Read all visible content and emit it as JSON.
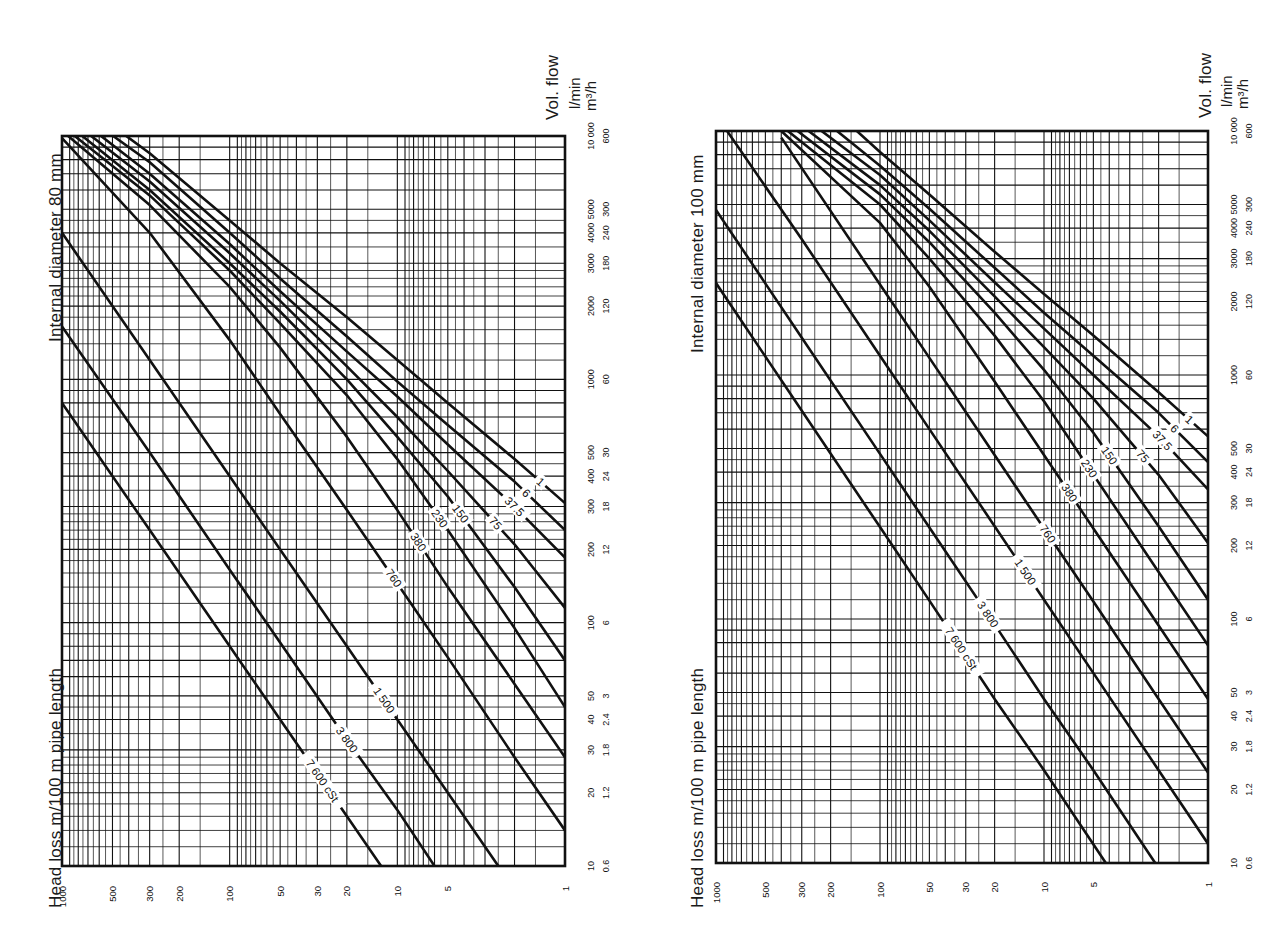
{
  "chart_data": [
    {
      "type": "line",
      "title": "Internal diameter 80 mm",
      "xlabel": "Head loss m/100 m pipe length",
      "ylabel": "Vol. flow",
      "y_units": [
        "l/min",
        "m³/h"
      ],
      "x_scale": "log",
      "y_scale": "log",
      "x_ticks": [
        1000,
        500,
        300,
        200,
        100,
        50,
        30,
        20,
        10,
        5,
        1
      ],
      "x_tick_labels": [
        "1000",
        "500",
        "300",
        "200",
        "100",
        "50",
        "30",
        "20",
        "10",
        "5",
        "1"
      ],
      "y_ticks_lmin": [
        10,
        20,
        30,
        40,
        50,
        100,
        200,
        300,
        400,
        500,
        1000,
        2000,
        3000,
        4000,
        5000,
        10000
      ],
      "y_tick_labels_lmin": [
        "10",
        "20",
        "30",
        "40",
        "50",
        "100",
        "200",
        "300",
        "400",
        "500",
        "1000",
        "2000",
        "3000",
        "4000",
        "5000",
        "10 000"
      ],
      "y_tick_labels_m3h": [
        "0.6",
        "1.2",
        "1.8",
        "2.4",
        "3",
        "6",
        "12",
        "18",
        "24",
        "30",
        "60",
        "120",
        "180",
        "240",
        "300",
        "600"
      ],
      "xlim": [
        1000,
        1
      ],
      "ylim": [
        10,
        10000
      ],
      "grid": true,
      "legend_position": "inline curve labels",
      "series": [
        {
          "name": "1",
          "label": "1",
          "points": [
            [
              1,
              310
            ],
            [
              2,
              470
            ],
            [
              5,
              800
            ],
            [
              10,
              1200
            ],
            [
              20,
              1800
            ],
            [
              50,
              3000
            ],
            [
              100,
              4500
            ],
            [
              300,
              8500
            ],
            [
              500,
              11000
            ]
          ]
        },
        {
          "name": "6",
          "label": "6",
          "points": [
            [
              1,
              240
            ],
            [
              2,
              380
            ],
            [
              5,
              650
            ],
            [
              10,
              980
            ],
            [
              20,
              1500
            ],
            [
              50,
              2600
            ],
            [
              100,
              4000
            ],
            [
              300,
              7800
            ],
            [
              600,
              11000
            ]
          ]
        },
        {
          "name": "37.5",
          "label": "37.5",
          "points": [
            [
              1,
              185
            ],
            [
              2,
              300
            ],
            [
              5,
              540
            ],
            [
              10,
              850
            ],
            [
              20,
              1300
            ],
            [
              50,
              2300
            ],
            [
              100,
              3600
            ],
            [
              300,
              7000
            ],
            [
              700,
              11000
            ]
          ]
        },
        {
          "name": "75",
          "label": "75",
          "points": [
            [
              1,
              115
            ],
            [
              2,
              210
            ],
            [
              5,
              420
            ],
            [
              10,
              700
            ],
            [
              20,
              1130
            ],
            [
              50,
              2100
            ],
            [
              100,
              3300
            ],
            [
              300,
              6500
            ],
            [
              800,
              11000
            ]
          ]
        },
        {
          "name": "150",
          "label": "150",
          "points": [
            [
              1,
              70
            ],
            [
              2,
              140
            ],
            [
              5,
              330
            ],
            [
              10,
              580
            ],
            [
              20,
              1000
            ],
            [
              50,
              1900
            ],
            [
              100,
              3000
            ],
            [
              300,
              6000
            ],
            [
              900,
              11000
            ]
          ]
        },
        {
          "name": "230",
          "label": "230",
          "points": [
            [
              1,
              45
            ],
            [
              2,
              95
            ],
            [
              5,
              240
            ],
            [
              10,
              470
            ],
            [
              20,
              860
            ],
            [
              50,
              1700
            ],
            [
              100,
              2800
            ],
            [
              300,
              5700
            ],
            [
              1000,
              11000
            ]
          ]
        },
        {
          "name": "380",
          "label": "380",
          "points": [
            [
              1,
              28
            ],
            [
              2,
              56
            ],
            [
              5,
              140
            ],
            [
              10,
              290
            ],
            [
              20,
              580
            ],
            [
              50,
              1350
            ],
            [
              100,
              2400
            ],
            [
              300,
              5200
            ],
            [
              1000,
              10500
            ]
          ]
        },
        {
          "name": "760",
          "label": "760",
          "points": [
            [
              1,
              14
            ],
            [
              2,
              28
            ],
            [
              5,
              72
            ],
            [
              10,
              145
            ],
            [
              20,
              290
            ],
            [
              50,
              720
            ],
            [
              100,
              1450
            ],
            [
              300,
              4000
            ],
            [
              1000,
              9800
            ]
          ]
        },
        {
          "name": "1 500",
          "label": "1 500",
          "points": [
            [
              2.5,
              10
            ],
            [
              5,
              20
            ],
            [
              10,
              40
            ],
            [
              20,
              80
            ],
            [
              50,
              200
            ],
            [
              100,
              400
            ],
            [
              300,
              1200
            ],
            [
              1000,
              4000
            ]
          ]
        },
        {
          "name": "3 800",
          "label": "3 800",
          "points": [
            [
              6,
              10
            ],
            [
              10,
              17
            ],
            [
              20,
              33
            ],
            [
              50,
              83
            ],
            [
              100,
              165
            ],
            [
              300,
              500
            ],
            [
              1000,
              1650
            ]
          ]
        },
        {
          "name": "7 600 cSt",
          "label": "7 600 cSt",
          "points": [
            [
              12.5,
              10
            ],
            [
              20,
              16
            ],
            [
              50,
              40
            ],
            [
              100,
              80
            ],
            [
              300,
              240
            ],
            [
              1000,
              800
            ]
          ]
        }
      ]
    },
    {
      "type": "line",
      "title": "Internal diameter 100 mm",
      "xlabel": "Head loss m/100 m pipe length",
      "ylabel": "Vol. flow",
      "y_units": [
        "l/min",
        "m³/h"
      ],
      "x_scale": "log",
      "y_scale": "log",
      "x_ticks": [
        1000,
        500,
        300,
        200,
        100,
        50,
        30,
        20,
        10,
        5,
        1
      ],
      "x_tick_labels": [
        "1000",
        "500",
        "300",
        "200",
        "100",
        "50",
        "30",
        "20",
        "10",
        "5",
        "1"
      ],
      "y_ticks_lmin": [
        10,
        20,
        30,
        40,
        50,
        100,
        200,
        300,
        400,
        500,
        1000,
        2000,
        3000,
        4000,
        5000,
        10000
      ],
      "y_tick_labels_lmin": [
        "10",
        "20",
        "30",
        "40",
        "50",
        "100",
        "200",
        "300",
        "400",
        "500",
        "1000",
        "2000",
        "3000",
        "4000",
        "5000",
        "10 000"
      ],
      "y_tick_labels_m3h": [
        "0.6",
        "1.2",
        "1.8",
        "2.4",
        "3",
        "6",
        "12",
        "18",
        "24",
        "30",
        "60",
        "120",
        "180",
        "240",
        "300",
        "600"
      ],
      "xlim": [
        1000,
        1
      ],
      "ylim": [
        10,
        10000
      ],
      "grid": true,
      "legend_position": "inline curve labels",
      "series": [
        {
          "name": "1",
          "label": "1",
          "points": [
            [
              1,
              560
            ],
            [
              2,
              850
            ],
            [
              5,
              1450
            ],
            [
              10,
              2150
            ],
            [
              20,
              3200
            ],
            [
              50,
              5500
            ],
            [
              100,
              8200
            ],
            [
              150,
              10500
            ]
          ]
        },
        {
          "name": "6",
          "label": "6",
          "points": [
            [
              1,
              440
            ],
            [
              2,
              700
            ],
            [
              5,
              1200
            ],
            [
              10,
              1800
            ],
            [
              20,
              2750
            ],
            [
              50,
              4800
            ],
            [
              100,
              7200
            ],
            [
              200,
              10500
            ]
          ]
        },
        {
          "name": "37.5",
          "label": "37.5",
          "points": [
            [
              1,
              340
            ],
            [
              2,
              560
            ],
            [
              5,
              1000
            ],
            [
              10,
              1550
            ],
            [
              20,
              2400
            ],
            [
              50,
              4300
            ],
            [
              100,
              6600
            ],
            [
              250,
              10500
            ]
          ]
        },
        {
          "name": "75",
          "label": "75",
          "points": [
            [
              1,
              205
            ],
            [
              2,
              390
            ],
            [
              5,
              800
            ],
            [
              10,
              1300
            ],
            [
              20,
              2100
            ],
            [
              50,
              3900
            ],
            [
              100,
              6000
            ],
            [
              300,
              10500
            ]
          ]
        },
        {
          "name": "150",
          "label": "150",
          "points": [
            [
              1,
              120
            ],
            [
              2,
              240
            ],
            [
              5,
              580
            ],
            [
              10,
              1050
            ],
            [
              20,
              1800
            ],
            [
              50,
              3500
            ],
            [
              100,
              5500
            ],
            [
              350,
              10500
            ]
          ]
        },
        {
          "name": "230",
          "label": "230",
          "points": [
            [
              1,
              78
            ],
            [
              2,
              156
            ],
            [
              5,
              390
            ],
            [
              10,
              780
            ],
            [
              20,
              1450
            ],
            [
              50,
              3000
            ],
            [
              100,
              5000
            ],
            [
              400,
              10500
            ]
          ]
        },
        {
          "name": "380",
          "label": "380",
          "points": [
            [
              1,
              47
            ],
            [
              2,
              94
            ],
            [
              5,
              235
            ],
            [
              10,
              470
            ],
            [
              20,
              940
            ],
            [
              50,
              2300
            ],
            [
              100,
              4200
            ],
            [
              400,
              10000
            ]
          ]
        },
        {
          "name": "760",
          "label": "760",
          "points": [
            [
              1,
              23.5
            ],
            [
              2,
              47
            ],
            [
              5,
              118
            ],
            [
              10,
              235
            ],
            [
              20,
              470
            ],
            [
              50,
              1175
            ],
            [
              100,
              2350
            ],
            [
              400,
              9400
            ]
          ]
        },
        {
          "name": "1 500",
          "label": "1 500",
          "points": [
            [
              1,
              12
            ],
            [
              2,
              24
            ],
            [
              5,
              60
            ],
            [
              10,
              120
            ],
            [
              20,
              240
            ],
            [
              50,
              600
            ],
            [
              100,
              1200
            ],
            [
              300,
              3600
            ],
            [
              900,
              10500
            ]
          ]
        },
        {
          "name": "3 800",
          "label": "3 800",
          "points": [
            [
              2.1,
              10
            ],
            [
              5,
              24
            ],
            [
              10,
              47
            ],
            [
              20,
              95
            ],
            [
              50,
              237
            ],
            [
              100,
              475
            ],
            [
              300,
              1420
            ],
            [
              1000,
              4750
            ]
          ]
        },
        {
          "name": "7 600 cSt",
          "label": "7 600 cSt",
          "points": [
            [
              4.2,
              10
            ],
            [
              10,
              24
            ],
            [
              20,
              47
            ],
            [
              50,
              119
            ],
            [
              100,
              238
            ],
            [
              300,
              714
            ],
            [
              1000,
              2380
            ]
          ]
        }
      ]
    }
  ],
  "panels": [
    {
      "title": "Internal diameter 80 mm",
      "xlabel": "Head loss m/100 m pipe length",
      "flow_label": "Vol. flow",
      "unit_lmin": "l/min",
      "unit_m3h": "m³/h"
    },
    {
      "title": "Internal diameter 100 mm",
      "xlabel": "Head loss m/100 m pipe length",
      "flow_label": "Vol. flow",
      "unit_lmin": "l/min",
      "unit_m3h": "m³/h"
    }
  ],
  "style": {
    "ink": "#111111",
    "paper": "#ffffff"
  }
}
